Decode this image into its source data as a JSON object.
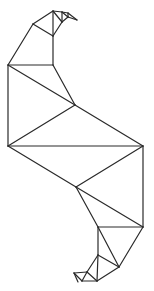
{
  "figure": {
    "stroke_color": "#2a2a2a",
    "background": "#ffffff",
    "edges": [
      [
        53,
        11,
        33,
        24
      ],
      [
        33,
        24,
        8,
        65
      ],
      [
        8,
        65,
        8,
        146
      ],
      [
        8,
        146,
        76,
        187
      ],
      [
        76,
        187,
        98,
        227
      ],
      [
        98,
        227,
        98,
        255
      ],
      [
        98,
        255,
        87,
        272
      ],
      [
        87,
        272,
        74,
        273
      ],
      [
        74,
        273,
        82,
        281
      ],
      [
        82,
        281,
        97,
        281
      ],
      [
        53,
        11,
        62,
        12
      ],
      [
        62,
        12,
        68,
        13
      ],
      [
        68,
        13,
        77,
        20
      ],
      [
        77,
        20,
        68,
        17
      ],
      [
        68,
        17,
        62,
        22
      ],
      [
        62,
        22,
        53,
        36
      ],
      [
        53,
        36,
        53,
        65
      ],
      [
        53,
        65,
        75,
        105
      ],
      [
        75,
        105,
        143,
        146
      ],
      [
        143,
        146,
        143,
        227
      ],
      [
        143,
        227,
        119,
        267
      ],
      [
        119,
        267,
        97,
        281
      ],
      [
        33,
        24,
        53,
        36
      ],
      [
        53,
        11,
        53,
        36
      ],
      [
        53,
        11,
        62,
        22
      ],
      [
        62,
        12,
        62,
        22
      ],
      [
        62,
        12,
        68,
        17
      ],
      [
        68,
        13,
        68,
        17
      ],
      [
        8,
        65,
        53,
        65
      ],
      [
        8,
        65,
        75,
        105
      ],
      [
        75,
        105,
        8,
        146
      ],
      [
        8,
        146,
        143,
        146
      ],
      [
        143,
        146,
        76,
        187
      ],
      [
        76,
        187,
        143,
        227
      ],
      [
        98,
        227,
        143,
        227
      ],
      [
        98,
        227,
        119,
        267
      ],
      [
        98,
        255,
        119,
        267
      ],
      [
        98,
        255,
        97,
        281
      ],
      [
        87,
        272,
        97,
        281
      ],
      [
        87,
        272,
        82,
        281
      ],
      [
        74,
        273,
        78,
        282
      ]
    ]
  }
}
